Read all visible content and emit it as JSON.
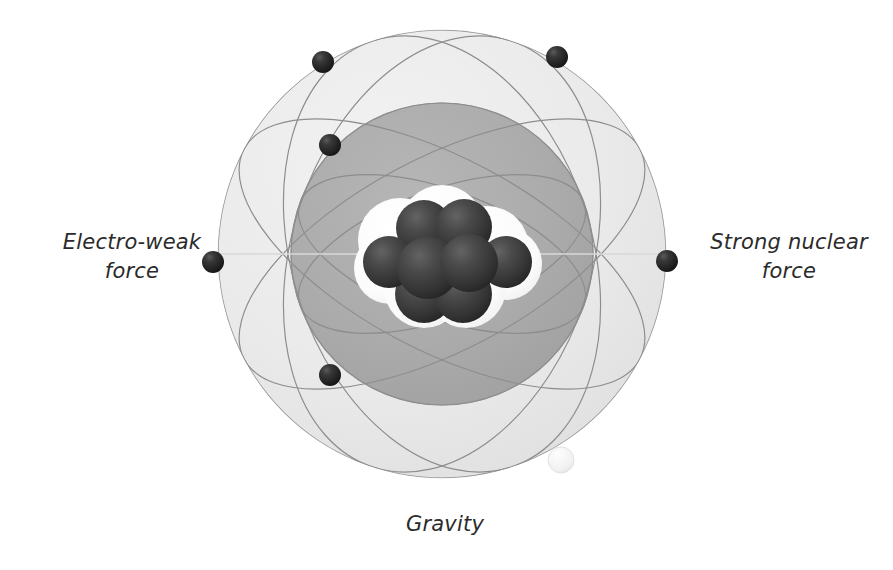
{
  "figure": {
    "background_color": "#ffffff"
  },
  "labels": {
    "electroweak": "Electro-weak\nforce",
    "strong_nuclear": "Strong nuclear\nforce",
    "gravity": "Gravity"
  },
  "colors": {
    "outer_shell": "#e9e9e9",
    "outer_shell_edge": "#dcdcdc",
    "inner_shell": "#ababab",
    "inner_shell_edge": "#9c9c9c",
    "orbit_line": "#8d8d8d",
    "nucleon_dark": "#3a3a3a",
    "nucleon_light": "#fbfbfb",
    "electron": "#262626",
    "text": "#2b2b2b"
  },
  "geometry": {
    "outer_shell": {
      "cx": 442,
      "cy": 254,
      "r": 224
    },
    "inner_shell": {
      "cx": 442,
      "cy": 254,
      "r": 151
    },
    "nucleus_center": {
      "cx": 448,
      "cy": 260
    }
  },
  "electrons": [
    {
      "name": "electron-top-left",
      "cx": 323,
      "cy": 62,
      "r": 11
    },
    {
      "name": "electron-top-right",
      "cx": 557,
      "cy": 57,
      "r": 11
    },
    {
      "name": "electron-upper-left",
      "cx": 330,
      "cy": 145,
      "r": 11
    },
    {
      "name": "electron-left",
      "cx": 213,
      "cy": 262,
      "r": 11
    },
    {
      "name": "electron-right",
      "cx": 667,
      "cy": 261,
      "r": 11
    },
    {
      "name": "electron-lower-left",
      "cx": 330,
      "cy": 375,
      "r": 11
    }
  ],
  "orbits": [
    {
      "name": "orbit-1",
      "rx": 224,
      "ry": 224,
      "rot": 0
    },
    {
      "name": "orbit-2",
      "rx": 224,
      "ry": 96,
      "rot": 28
    },
    {
      "name": "orbit-3",
      "rx": 224,
      "ry": 96,
      "rot": -28
    },
    {
      "name": "orbit-4",
      "rx": 224,
      "ry": 150,
      "rot": 72
    },
    {
      "name": "orbit-5",
      "rx": 224,
      "ry": 150,
      "rot": -72
    },
    {
      "name": "orbit-6",
      "rx": 151,
      "ry": 151,
      "rot": 0
    },
    {
      "name": "orbit-7",
      "rx": 151,
      "ry": 64,
      "rot": 20
    },
    {
      "name": "orbit-8",
      "rx": 151,
      "ry": 64,
      "rot": -20
    }
  ],
  "nucleons_light": [
    {
      "name": "nucleon-light-1",
      "cx": 400,
      "cy": 240,
      "r": 42
    },
    {
      "name": "nucleon-light-2",
      "cx": 442,
      "cy": 227,
      "r": 42
    },
    {
      "name": "nucleon-light-3",
      "cx": 487,
      "cy": 248,
      "r": 42
    },
    {
      "name": "nucleon-light-4",
      "cx": 506,
      "cy": 264,
      "r": 36
    },
    {
      "name": "nucleon-light-5",
      "cx": 390,
      "cy": 268,
      "r": 36
    },
    {
      "name": "nucleon-light-6",
      "cx": 424,
      "cy": 288,
      "r": 40
    },
    {
      "name": "nucleon-light-7",
      "cx": 466,
      "cy": 288,
      "r": 40
    }
  ],
  "nucleons_dark": [
    {
      "name": "nucleon-dark-top-left",
      "cx": 424,
      "cy": 228,
      "r": 28
    },
    {
      "name": "nucleon-dark-top-right",
      "cx": 464,
      "cy": 227,
      "r": 28
    },
    {
      "name": "nucleon-dark-mid-far-left",
      "cx": 389,
      "cy": 262,
      "r": 26
    },
    {
      "name": "nucleon-dark-mid-left",
      "cx": 428,
      "cy": 268,
      "r": 31
    },
    {
      "name": "nucleon-dark-mid-right",
      "cx": 469,
      "cy": 263,
      "r": 29
    },
    {
      "name": "nucleon-dark-mid-far-right",
      "cx": 506,
      "cy": 262,
      "r": 26
    },
    {
      "name": "nucleon-dark-bottom-left",
      "cx": 424,
      "cy": 294,
      "r": 29
    },
    {
      "name": "nucleon-dark-bottom-right",
      "cx": 463,
      "cy": 294,
      "r": 29
    }
  ],
  "satellite": {
    "name": "small-satellite-sphere",
    "cx": 561,
    "cy": 460,
    "r": 13
  }
}
